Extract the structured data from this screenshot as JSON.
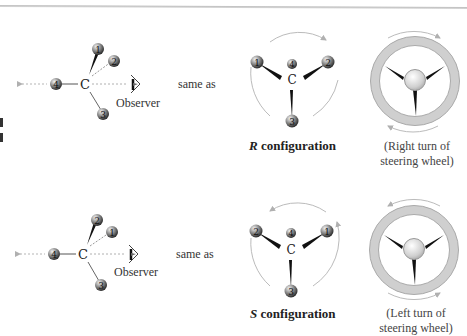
{
  "figure": {
    "panels": [
      {
        "id": "R",
        "perspective_view": {
          "center_atom": "C",
          "substituents": [
            "1",
            "2",
            "3",
            "4"
          ],
          "observer_label": "Observer"
        },
        "same_as_label": "same as",
        "projection": {
          "center_atom": "C",
          "substituents_left_to_right": [
            "1",
            "4",
            "2"
          ],
          "bottom": "3",
          "rotation": "clockwise"
        },
        "config_letter": "R",
        "config_word": "configuration",
        "wheel_caption_line1": "(Right turn of",
        "wheel_caption_line2": "steering wheel)"
      },
      {
        "id": "S",
        "perspective_view": {
          "center_atom": "C",
          "substituents": [
            "2",
            "1",
            "3",
            "4"
          ],
          "observer_label": "Observer"
        },
        "same_as_label": "same as",
        "projection": {
          "center_atom": "C",
          "substituents_left_to_right": [
            "2",
            "4",
            "1"
          ],
          "bottom": "3",
          "rotation": "counterclockwise"
        },
        "config_letter": "S",
        "config_word": "configuration",
        "wheel_caption_line1": "(Left turn of",
        "wheel_caption_line2": "steering wheel)"
      }
    ],
    "colors": {
      "atom_dark": "#3a3a3a",
      "atom_light": "#d8d8d8",
      "arrow_gray": "#b5b5b5",
      "wheel_rim": "#c8c8c8",
      "text": "#333333"
    }
  }
}
